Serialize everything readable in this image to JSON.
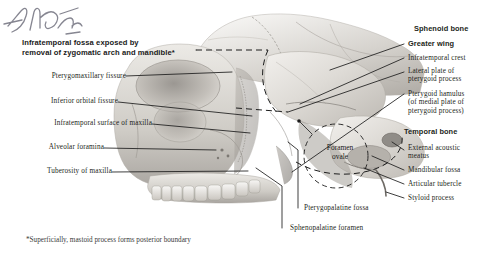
{
  "plate": {
    "title": "Infratemporal fossa exposed by\nremoval of zygomatic arch and mandible*",
    "footnote": "*Superficially, mastoid process forms posterior boundary",
    "signature": "F. Netter",
    "background_color": "#ffffff",
    "text_color": "#231f20",
    "bone_color": "#d9d6d1",
    "leader_color": "#1c1c1c"
  },
  "labels_left": [
    {
      "text": "Pterygomaxillary fissure",
      "bold": false
    },
    {
      "text": "Inferior orbital fissure",
      "bold": false
    },
    {
      "text": "Infratemporal surface of maxilla",
      "bold": false
    },
    {
      "text": "Alveolar foramina",
      "bold": false
    },
    {
      "text": "Tuberosity of maxilla",
      "bold": false
    }
  ],
  "labels_right": [
    {
      "text": "Sphenoid bone",
      "bold": true
    },
    {
      "text": "Greater wing",
      "bold": true
    },
    {
      "text": "Infratemporal crest",
      "bold": false
    },
    {
      "text": "Lateral plate of\npterygoid process",
      "bold": false
    },
    {
      "text": "Pterygoid hamulus\n(of medial plate of\npterygoid process)",
      "bold": false
    },
    {
      "text": "Temporal bone",
      "bold": true
    },
    {
      "text": "External acoustic\nmeatus",
      "bold": false
    },
    {
      "text": "Mandibular fossa",
      "bold": false
    },
    {
      "text": "Articular tubercle",
      "bold": false
    },
    {
      "text": "Styloid process",
      "bold": false
    }
  ],
  "labels_bottom": [
    {
      "text": "Pterygopalatine fossa",
      "bold": false
    },
    {
      "text": "Sphenopalatine foramen",
      "bold": false
    }
  ],
  "labels_inline": [
    {
      "text": "Foramen\novale",
      "bold": false
    }
  ]
}
